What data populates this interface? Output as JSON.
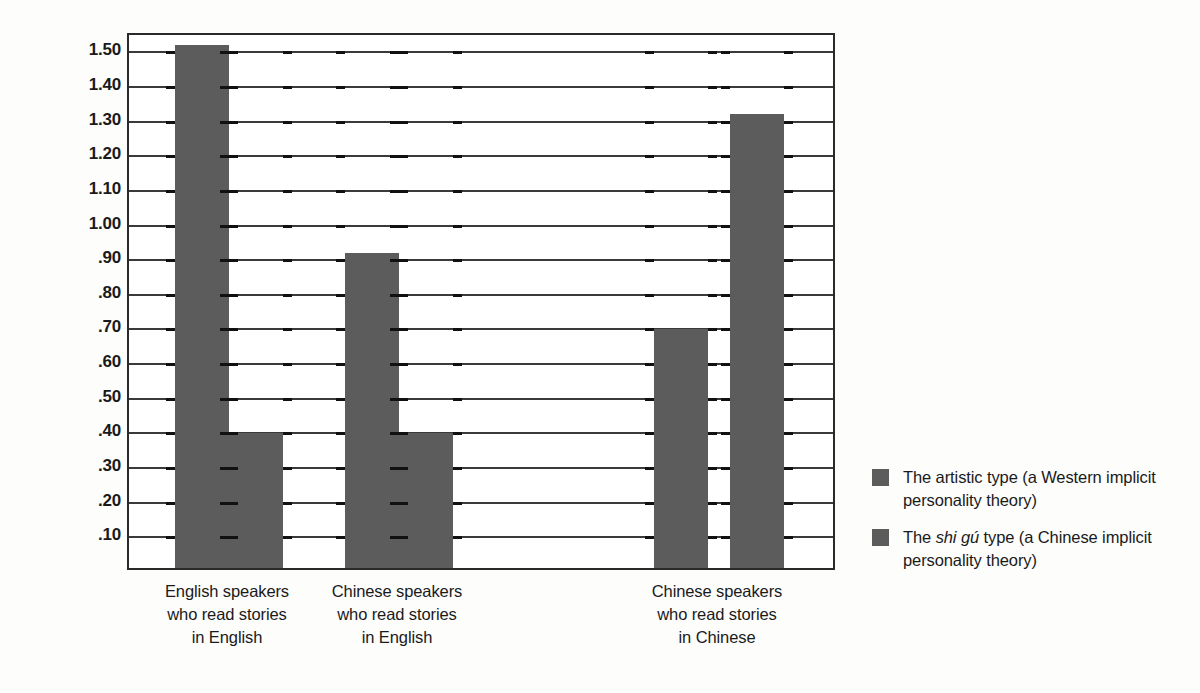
{
  "chart_data": {
    "type": "bar",
    "title": "",
    "xlabel": "",
    "ylabel": "Mean number of new schematic traits",
    "ylim": [
      0,
      1.55
    ],
    "ytick_values": [
      1.5,
      1.4,
      1.3,
      1.2,
      1.1,
      1.0,
      0.9,
      0.8,
      0.7,
      0.6,
      0.5,
      0.4,
      0.3,
      0.2,
      0.1
    ],
    "ytick_labels": [
      "1.50",
      "1.40",
      "1.30",
      "1.20",
      "1.10",
      "1.00",
      ".90",
      ".80",
      ".70",
      ".60",
      ".50",
      ".40",
      ".30",
      ".20",
      ".10"
    ],
    "grid": true,
    "legend_position": "right",
    "categories": [
      "English speakers\nwho read stories\nin English",
      "Chinese speakers\nwho read stories\nin English",
      "Chinese speakers\nwho read stories\nin Chinese"
    ],
    "category_lines": [
      [
        "English speakers",
        "who read stories",
        "in English"
      ],
      [
        "Chinese speakers",
        "who read stories",
        "in English"
      ],
      [
        "Chinese speakers",
        "who read stories",
        "in Chinese"
      ]
    ],
    "series": [
      {
        "name": "The artistic type (a Western implicit personality theory)",
        "values": [
          1.51,
          0.91,
          0.69
        ],
        "color": "#5c5c5c"
      },
      {
        "name": "The shi gú type (a Chinese implicit personality theory)",
        "values": [
          0.39,
          0.39,
          1.31
        ],
        "color": "#5c5c5c"
      }
    ]
  },
  "legend": {
    "items": [
      {
        "prefix": "The artistic type (a Western implicit",
        "italic": "",
        "suffix": "",
        "line2": "personality theory)",
        "color": "#5c5c5c"
      },
      {
        "prefix": "The ",
        "italic": "shi gú",
        "suffix": " type (a Chinese implicit",
        "line2": "personality theory)",
        "color": "#5c5c5c"
      }
    ]
  },
  "colors": {
    "bar": "#5c5c5c",
    "axis": "#2a2a2a",
    "grid": "#3a3a3a",
    "background": "#fdfdfc",
    "text": "#1a1a1a"
  }
}
